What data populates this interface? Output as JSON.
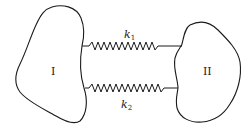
{
  "diagram": {
    "bodies": [
      {
        "id": "body-1",
        "label": "I"
      },
      {
        "id": "body-2",
        "label": "II"
      }
    ],
    "springs": [
      {
        "id": "spring-1",
        "symbol": "k",
        "subscript": "1",
        "position": "top"
      },
      {
        "id": "spring-2",
        "symbol": "k",
        "subscript": "2",
        "position": "bottom"
      }
    ],
    "colors": {
      "stroke": "#1a1a1a",
      "background": "#ffffff"
    }
  }
}
